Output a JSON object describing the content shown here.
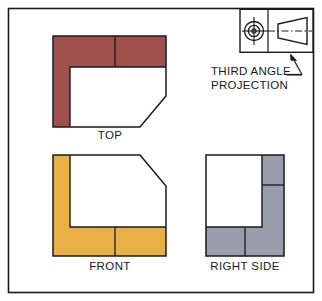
{
  "sheet": {
    "title": "Third Angle Projection Orthographic Views",
    "background_color": "#ffffff",
    "border_color": "#1a1a1a"
  },
  "colors": {
    "top_view_fill": "#a0504a",
    "front_view_fill": "#e8b045",
    "right_side_fill": "#9a9eac",
    "line_color": "#1a1a1a",
    "face_fill": "#ffffff"
  },
  "views": [
    {
      "id": "top",
      "label": "TOP",
      "fill_color": "#a0504a",
      "description": "Top orthographic view of L-shaped block with chamfered corner"
    },
    {
      "id": "front",
      "label": "FRONT",
      "fill_color": "#e8b045",
      "description": "Front orthographic view of L-shaped block with chamfered corner"
    },
    {
      "id": "right_side",
      "label": "RIGHT SIDE",
      "fill_color": "#9a9eac",
      "description": "Right side orthographic view of L-shaped block"
    }
  ],
  "annotation": {
    "line1": "THIRD ANGLE",
    "line2": "PROJECTION",
    "symbol_name": "third-angle-projection-symbol",
    "symbol_parts": [
      "concentric-circles",
      "truncated-cone",
      "center-line"
    ]
  }
}
